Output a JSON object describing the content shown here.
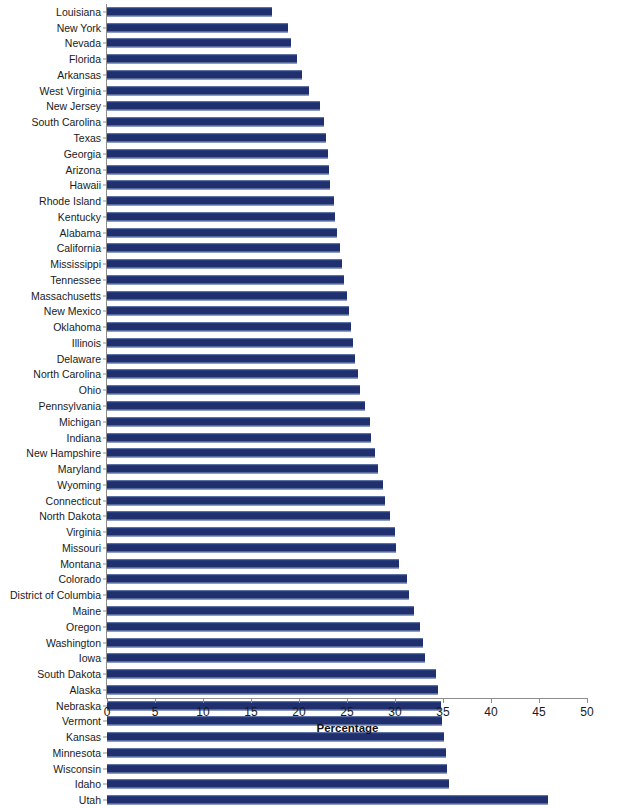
{
  "chart_data": {
    "type": "bar",
    "orientation": "horizontal",
    "title": "",
    "subtitle": "",
    "xlabel": "Percentage",
    "ylabel": "",
    "xlim": [
      0,
      50
    ],
    "xticks": [
      0,
      5,
      10,
      15,
      20,
      25,
      30,
      35,
      40,
      45,
      50
    ],
    "xtick_labels": [
      "0",
      "5",
      "10",
      "15",
      "20",
      "25",
      "30",
      "35",
      "40",
      "45",
      "50"
    ],
    "grid": false,
    "legend": null,
    "bar_color": "#20306f",
    "axis_color": "#8d8d8d",
    "categories": [
      "Louisiana",
      "New York",
      "Nevada",
      "Florida",
      "Arkansas",
      "West Virginia",
      "New Jersey",
      "South Carolina",
      "Texas",
      "Georgia",
      "Arizona",
      "Hawaii",
      "Rhode Island",
      "Kentucky",
      "Alabama",
      "California",
      "Mississippi",
      "Tennessee",
      "Massachusetts",
      "New Mexico",
      "Oklahoma",
      "Illinois",
      "Delaware",
      "North Carolina",
      "Ohio",
      "Pennsylvania",
      "Michigan",
      "Indiana",
      "New Hampshire",
      "Maryland",
      "Wyoming",
      "Connecticut",
      "North Dakota",
      "Virginia",
      "Missouri",
      "Montana",
      "Colorado",
      "District of Columbia",
      "Maine",
      "Oregon",
      "Washington",
      "Iowa",
      "South Dakota",
      "Alaska",
      "Nebraska",
      "Vermont",
      "Kansas",
      "Minnesota",
      "Wisconsin",
      "Idaho",
      "Utah"
    ],
    "values": [
      17.2,
      18.9,
      19.2,
      19.8,
      20.3,
      21.0,
      22.2,
      22.6,
      22.8,
      23.0,
      23.1,
      23.2,
      23.6,
      23.7,
      24.0,
      24.3,
      24.5,
      24.7,
      25.0,
      25.2,
      25.4,
      25.6,
      25.8,
      26.1,
      26.4,
      26.9,
      27.4,
      27.5,
      27.9,
      28.2,
      28.7,
      29.0,
      29.5,
      30.0,
      30.1,
      30.4,
      31.2,
      31.5,
      32.0,
      32.6,
      32.9,
      33.1,
      34.3,
      34.5,
      34.8,
      34.9,
      35.1,
      35.3,
      35.4,
      35.6,
      45.9
    ]
  }
}
